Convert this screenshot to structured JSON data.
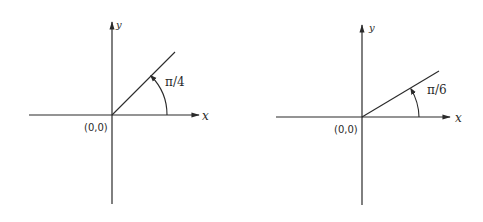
{
  "diagrams": [
    {
      "id": "left",
      "origin_label": "(0,0)",
      "x_label": "x",
      "y_label": "y",
      "angle_label": "π/4",
      "angle_degrees": 45,
      "geometry": {
        "ox": 112,
        "oy": 115,
        "x_start": 29,
        "x_end": 200,
        "y_top": 22,
        "y_bottom": 204,
        "ray_end": [
          175,
          52
        ],
        "arc_radius": 55
      }
    },
    {
      "id": "right",
      "origin_label": "(0,0)",
      "x_label": "x",
      "y_label": "y",
      "angle_label": "π/6",
      "angle_degrees": 30,
      "geometry": {
        "ox": 362,
        "oy": 117,
        "x_start": 276,
        "x_end": 451,
        "y_top": 25,
        "y_bottom": 205,
        "ray_end": [
          439,
          71
        ],
        "arc_radius": 57
      }
    }
  ],
  "colors": {
    "ink": "#2a2a2a",
    "background": "#ffffff"
  }
}
